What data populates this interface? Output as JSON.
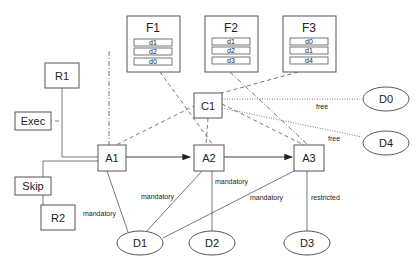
{
  "diagram": {
    "forms": [
      {
        "id": "F1",
        "label": "F1",
        "fields": [
          "d1",
          "d2",
          "d0"
        ]
      },
      {
        "id": "F2",
        "label": "F2",
        "fields": [
          "d1",
          "d2",
          "d3"
        ]
      },
      {
        "id": "F3",
        "label": "F3",
        "fields": [
          "d0",
          "d1",
          "d4"
        ]
      }
    ],
    "roles": [
      {
        "id": "R1",
        "label": "R1"
      },
      {
        "id": "R2",
        "label": "R2"
      }
    ],
    "operations": [
      {
        "id": "Exec",
        "label": "Exec"
      },
      {
        "id": "Skip",
        "label": "Skip"
      }
    ],
    "condition": {
      "id": "C1",
      "label": "C1"
    },
    "activities": [
      {
        "id": "A1",
        "label": "A1"
      },
      {
        "id": "A2",
        "label": "A2"
      },
      {
        "id": "A3",
        "label": "A3"
      }
    ],
    "data_items": [
      {
        "id": "D0",
        "label": "D0"
      },
      {
        "id": "D1",
        "label": "D1"
      },
      {
        "id": "D2",
        "label": "D2"
      },
      {
        "id": "D3",
        "label": "D3"
      },
      {
        "id": "D4",
        "label": "D4"
      }
    ],
    "edge_labels": {
      "c1_d0": "free",
      "c1_d4": "free",
      "a1_d1": "mandatory",
      "a2_d1": "mandatory",
      "a2_d2": "mandatory",
      "a3_d1": "mandatory",
      "a3_d3": "restricted"
    },
    "colors": {
      "stroke": "#555555",
      "text": "#222222",
      "background": "#ffffff"
    }
  }
}
